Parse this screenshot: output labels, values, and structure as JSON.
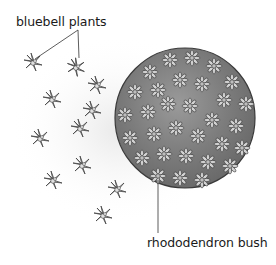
{
  "labels": {
    "bluebell": "bluebell plants",
    "rhododendron": "rhododendron bush"
  },
  "figure": {
    "bush": {
      "cx": 185,
      "cy": 118,
      "r": 70,
      "fill": "#8a8a8a",
      "outline": "#333333"
    },
    "bluebell_plants": [
      {
        "x": 33,
        "y": 62
      },
      {
        "x": 76,
        "y": 67
      },
      {
        "x": 97,
        "y": 85
      },
      {
        "x": 52,
        "y": 99
      },
      {
        "x": 92,
        "y": 110
      },
      {
        "x": 80,
        "y": 128
      },
      {
        "x": 40,
        "y": 138
      },
      {
        "x": 82,
        "y": 165
      },
      {
        "x": 53,
        "y": 180
      },
      {
        "x": 117,
        "y": 189
      },
      {
        "x": 103,
        "y": 215
      }
    ]
  }
}
